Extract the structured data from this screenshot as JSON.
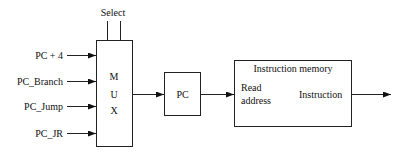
{
  "diagram": {
    "mux": {
      "select_label": "Select",
      "letters": [
        "M",
        "U",
        "X"
      ],
      "inputs": [
        {
          "label": "PC + 4"
        },
        {
          "label": "PC_Branch"
        },
        {
          "label": "PC_Jump"
        },
        {
          "label": "PC_JR"
        }
      ]
    },
    "pc": {
      "label": "PC"
    },
    "instruction_memory": {
      "title": "Instruction memory",
      "input_label_line1": "Read",
      "input_label_line2": "address",
      "output_label": "Instruction"
    },
    "colors": {
      "stroke": "#222222",
      "background": "#ffffff"
    }
  }
}
